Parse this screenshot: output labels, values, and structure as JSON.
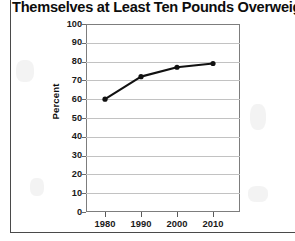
{
  "page": {
    "width": 295,
    "height": 241,
    "background": "#ffffff",
    "frame_color": "#4a4a4a"
  },
  "title": {
    "line1": "Percentage of Americans Who Consider",
    "line2": "Themselves at Least Ten Pounds Overweight"
  },
  "axis": {
    "y_title": "Percent",
    "y_ticks": [
      "100",
      "90",
      "80",
      "70",
      "60",
      "50",
      "40",
      "30",
      "20",
      "10",
      "0"
    ],
    "x_ticks": [
      "1980",
      "1990",
      "2000",
      "2010"
    ]
  },
  "colors": {
    "line": "#111111",
    "marker": "#111111",
    "grid": "#c2c2c2",
    "plot_border": "#7d7d7d",
    "text": "#1a1a1a"
  },
  "chart_data": {
    "type": "line",
    "title": "Percentage of Americans Who Consider Themselves at Least Ten Pounds Overweight",
    "xlabel": "",
    "ylabel": "Percent",
    "x": [
      "1980",
      "1990",
      "2000",
      "2010"
    ],
    "categories": [
      "1980",
      "1990",
      "2000",
      "2010"
    ],
    "values": [
      60,
      72,
      77,
      79
    ],
    "series": [
      {
        "name": "Percent overweight by self-report",
        "values": [
          60,
          72,
          77,
          79
        ]
      }
    ],
    "ylim": [
      0,
      100
    ],
    "ytick_step": 10,
    "yticks": [
      0,
      10,
      20,
      30,
      40,
      50,
      60,
      70,
      80,
      90,
      100
    ],
    "grid": true,
    "grid_axis": "y",
    "legend": false,
    "legend_position": "none",
    "marker": "circle",
    "line_color": "#111111"
  }
}
